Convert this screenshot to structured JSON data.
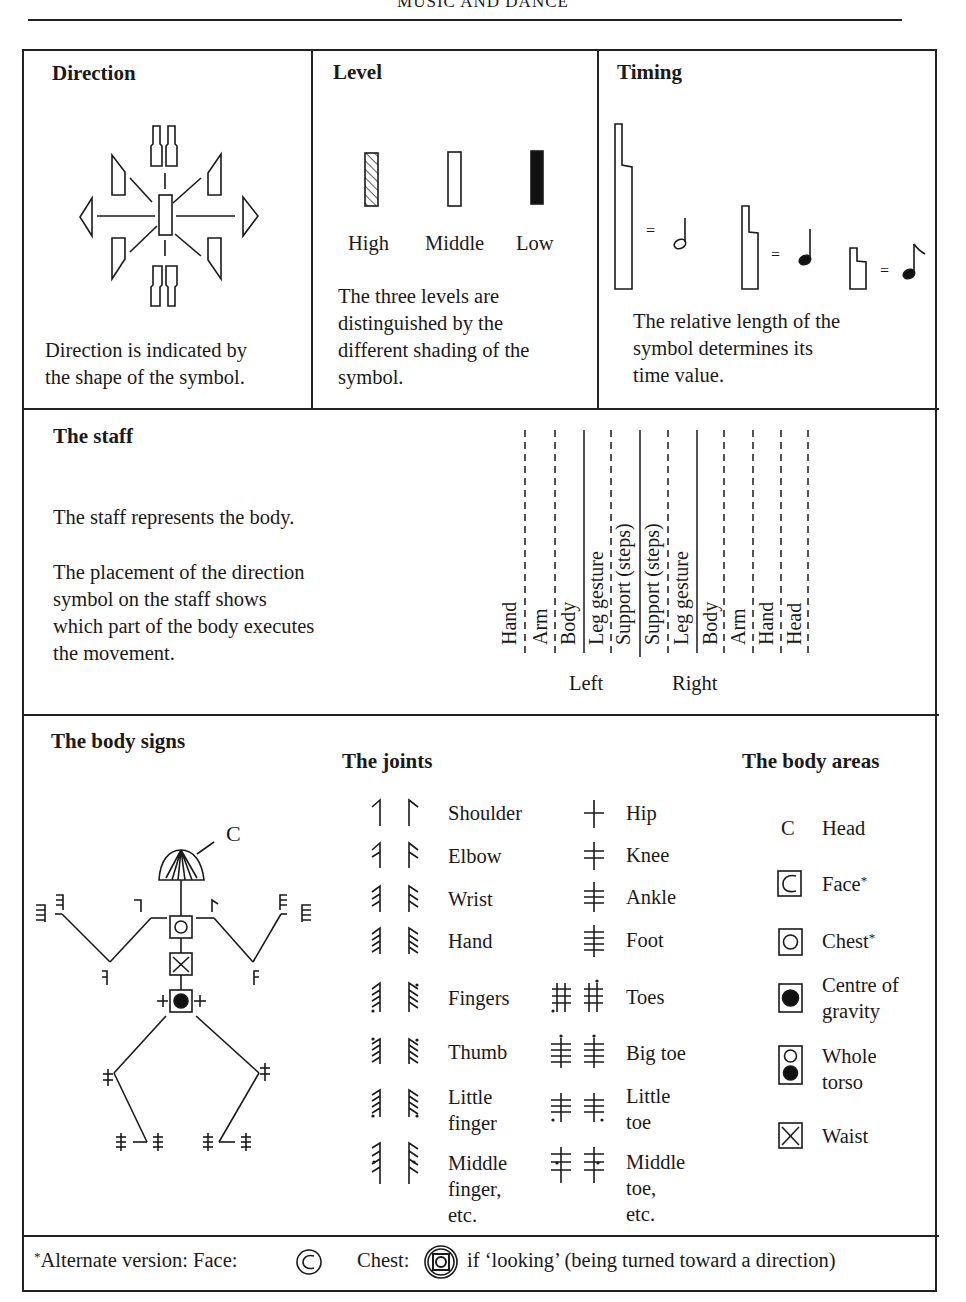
{
  "running_head": "MUSIC AND DANCE",
  "direction": {
    "title": "Direction",
    "caption_line1": "Direction is indicated by",
    "caption_line2": "the shape of the symbol."
  },
  "level": {
    "title": "Level",
    "symbols": [
      {
        "label": "High",
        "shading": "hatched"
      },
      {
        "label": "Middle",
        "shading": "empty"
      },
      {
        "label": "Low",
        "shading": "solid"
      }
    ],
    "caption_lines": [
      "The three levels are",
      "distinguished by the",
      "different shading of the",
      "symbol."
    ]
  },
  "timing": {
    "title": "Timing",
    "equals": "=",
    "equivalents": [
      {
        "symbol_length": "long",
        "note": "half-note"
      },
      {
        "symbol_length": "medium",
        "note": "quarter-note"
      },
      {
        "symbol_length": "short",
        "note": "eighth-note"
      }
    ],
    "caption_lines": [
      "The relative length of the",
      "symbol determines its",
      "time value."
    ]
  },
  "staff": {
    "title": "The staff",
    "text1": "The staff represents the body.",
    "text2_lines": [
      "The placement of the direction",
      "symbol on the staff shows",
      "which part of the body executes",
      "the movement."
    ],
    "columns": [
      "Hand",
      "Arm",
      "Body",
      "Leg gesture",
      "Support (steps)",
      "Support (steps)",
      "Leg gesture",
      "Body",
      "Arm",
      "Hand",
      "Head"
    ],
    "left_label": "Left",
    "right_label": "Right"
  },
  "body_signs": {
    "title": "The body signs",
    "head_marker": "C"
  },
  "joints": {
    "title": "The joints",
    "arm_items": [
      {
        "label_lines": [
          "Shoulder"
        ]
      },
      {
        "label_lines": [
          "Elbow"
        ]
      },
      {
        "label_lines": [
          "Wrist"
        ]
      },
      {
        "label_lines": [
          "Hand"
        ]
      },
      {
        "label_lines": [
          "Fingers"
        ]
      },
      {
        "label_lines": [
          "Thumb"
        ]
      },
      {
        "label_lines": [
          "Little",
          "finger"
        ]
      },
      {
        "label_lines": [
          "Middle",
          "finger,",
          "etc."
        ]
      }
    ],
    "leg_items": [
      {
        "label_lines": [
          "Hip"
        ]
      },
      {
        "label_lines": [
          "Knee"
        ]
      },
      {
        "label_lines": [
          "Ankle"
        ]
      },
      {
        "label_lines": [
          "Foot"
        ]
      },
      {
        "label_lines": [
          "Toes"
        ]
      },
      {
        "label_lines": [
          "Big toe"
        ]
      },
      {
        "label_lines": [
          "Little",
          "toe"
        ]
      },
      {
        "label_lines": [
          "Middle",
          "toe,",
          "etc."
        ]
      }
    ]
  },
  "body_areas": {
    "title": "The body areas",
    "items": [
      {
        "sign": "C",
        "label_lines": [
          "Head"
        ],
        "asterisk": false
      },
      {
        "sign": "boxed-C",
        "label_lines": [
          "Face"
        ],
        "asterisk": true
      },
      {
        "sign": "boxed-open-circle",
        "label_lines": [
          "Chest"
        ],
        "asterisk": true
      },
      {
        "sign": "boxed-filled-circle",
        "label_lines": [
          "Centre of",
          "gravity"
        ],
        "asterisk": false
      },
      {
        "sign": "boxed-open-over-filled",
        "label_lines": [
          "Whole",
          "torso"
        ],
        "asterisk": false
      },
      {
        "sign": "boxed-X",
        "label_lines": [
          "Waist"
        ],
        "asterisk": false
      }
    ],
    "asterisk": "*"
  },
  "footnote": {
    "asterisk": "*",
    "text1": "Alternate version: Face:",
    "face_glyph": "C",
    "text2": "Chest:",
    "text3": "if ‘looking’ (being turned toward a direction)"
  }
}
